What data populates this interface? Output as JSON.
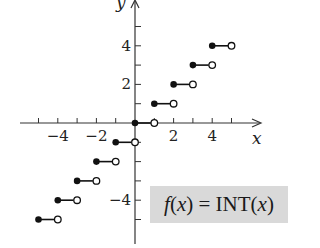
{
  "chart_data": {
    "type": "step",
    "title": "f(x) = INT(x)",
    "function_label": "f(x) = INT(x)",
    "xlabel": "x",
    "ylabel": "y",
    "xlim": [
      -5.5,
      6
    ],
    "ylim": [
      -6,
      6
    ],
    "x_tick_labels": [
      "-4",
      "-2",
      "2",
      "4"
    ],
    "x_ticks": [
      -5,
      -4,
      -3,
      -2,
      -1,
      1,
      2,
      3,
      4,
      5
    ],
    "y_tick_labels": [
      "4",
      "2",
      "-4"
    ],
    "y_ticks": [
      -5,
      -4,
      -3,
      -2,
      -1,
      1,
      2,
      3,
      4,
      5
    ],
    "grid": false,
    "segments": [
      {
        "x_start": -5,
        "x_end": -4,
        "y": -5,
        "closed_left": true,
        "open_right": true
      },
      {
        "x_start": -4,
        "x_end": -3,
        "y": -4,
        "closed_left": true,
        "open_right": true
      },
      {
        "x_start": -3,
        "x_end": -2,
        "y": -3,
        "closed_left": true,
        "open_right": true
      },
      {
        "x_start": -2,
        "x_end": -1,
        "y": -2,
        "closed_left": true,
        "open_right": true
      },
      {
        "x_start": -1,
        "x_end": 0,
        "y": -1,
        "closed_left": true,
        "open_right": true
      },
      {
        "x_start": 0,
        "x_end": 1,
        "y": 0,
        "closed_left": true,
        "open_right": true
      },
      {
        "x_start": 1,
        "x_end": 2,
        "y": 1,
        "closed_left": true,
        "open_right": true
      },
      {
        "x_start": 2,
        "x_end": 3,
        "y": 2,
        "closed_left": true,
        "open_right": true
      },
      {
        "x_start": 3,
        "x_end": 4,
        "y": 3,
        "closed_left": true,
        "open_right": true
      },
      {
        "x_start": 4,
        "x_end": 5,
        "y": 4,
        "closed_left": true,
        "open_right": true
      }
    ]
  },
  "labels": {
    "x_axis": "x",
    "y_axis": "y",
    "formula_f": "f",
    "formula_lparen": "(",
    "formula_x": "x",
    "formula_rest": ") = INT(",
    "formula_x2": "x",
    "formula_end": ")"
  },
  "colors": {
    "axis": "#333333",
    "segment": "#111111",
    "formula_bg": "#d9d9d9"
  }
}
